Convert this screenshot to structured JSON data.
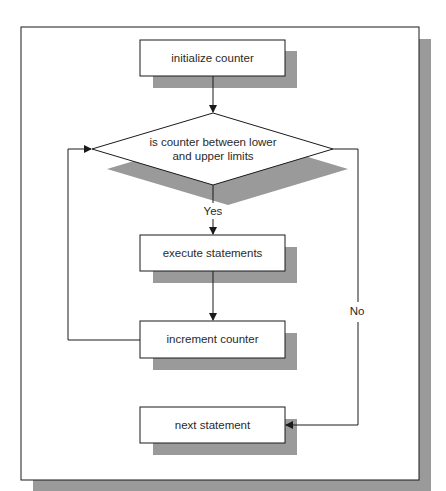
{
  "diagram": {
    "type": "flowchart",
    "title": "",
    "colors": {
      "line": "#1a1a1a",
      "shadow": "#9a9a9a",
      "fill": "#ffffff",
      "text": "#2a2a2a"
    },
    "nodes": [
      {
        "id": "init",
        "shape": "process",
        "label": "initialize counter"
      },
      {
        "id": "cond",
        "shape": "decision",
        "label_line1": "is counter between lower",
        "label_line2": "and upper limits"
      },
      {
        "id": "exec",
        "shape": "process",
        "label": "execute statements"
      },
      {
        "id": "incr",
        "shape": "process",
        "label": "increment counter"
      },
      {
        "id": "next",
        "shape": "process",
        "label": "next statement"
      }
    ],
    "edges": [
      {
        "from": "init",
        "to": "cond",
        "label": ""
      },
      {
        "from": "cond",
        "to": "exec",
        "label": "Yes"
      },
      {
        "from": "exec",
        "to": "incr",
        "label": ""
      },
      {
        "from": "incr",
        "to": "cond",
        "label": ""
      },
      {
        "from": "cond",
        "to": "next",
        "label": "No"
      }
    ]
  }
}
